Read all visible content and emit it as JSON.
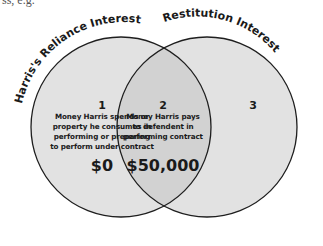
{
  "top_cut_text": "ss, e.g.",
  "circles": [
    {
      "label": "Harris's Reliance Interest",
      "fill": "#e2e2e2"
    },
    {
      "label": "Restitution Interest",
      "fill": "#e2e2e2"
    }
  ],
  "intersection_fill": "#d2d2d2",
  "stroke_color": "#1e1e1e",
  "regions": [
    {
      "number": "1",
      "description_lines": [
        "Money Harris spends or",
        "property he consumes in",
        "performing or preparing",
        "to perform under contract"
      ],
      "amount": "$0"
    },
    {
      "number": "2",
      "description_lines": [
        "Money Harris pays",
        "to defendent in",
        "performing contract"
      ],
      "amount": "$50,000"
    },
    {
      "number": "3",
      "description_lines": [],
      "amount": ""
    }
  ]
}
